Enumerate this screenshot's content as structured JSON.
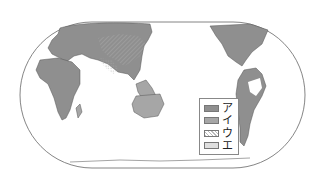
{
  "map": {
    "type": "world-map-pacific-centered",
    "colors": {
      "land_fill_a": "#8f8f8f",
      "land_fill_i": "#a6a6a6",
      "outline": "#555555",
      "ocean": "#ffffff"
    }
  },
  "legend": {
    "items": [
      {
        "label": "ア",
        "pattern": "solid-dark-gray"
      },
      {
        "label": "イ",
        "pattern": "solid-gray"
      },
      {
        "label": "ウ",
        "pattern": "hatched"
      },
      {
        "label": "エ",
        "pattern": "dotted"
      }
    ]
  }
}
